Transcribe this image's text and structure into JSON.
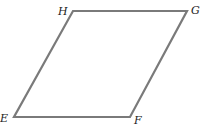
{
  "diagram": {
    "shape": "parallelogram",
    "stroke_color": "#7a7a7a",
    "vertices": [
      {
        "label": "H",
        "x": 73,
        "y": 11,
        "lx": 58,
        "ly": 15
      },
      {
        "label": "G",
        "x": 187,
        "y": 11,
        "lx": 191,
        "ly": 14
      },
      {
        "label": "F",
        "x": 130,
        "y": 117,
        "lx": 134,
        "ly": 124
      },
      {
        "label": "E",
        "x": 14,
        "y": 117,
        "lx": 0,
        "ly": 122
      }
    ]
  }
}
